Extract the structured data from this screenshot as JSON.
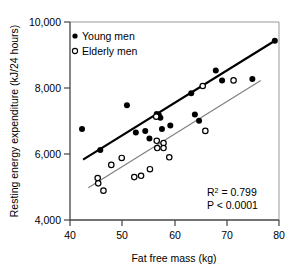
{
  "chart_data": {
    "type": "scatter",
    "title": "",
    "xlabel": "Fat free mass (kg)",
    "ylabel": "Resting energy expenditure (kJ/24 hours)",
    "xlim": [
      40,
      80
    ],
    "ylim": [
      4000,
      10000
    ],
    "xticks": [
      "40",
      "50",
      "60",
      "70",
      "80"
    ],
    "xtick_values": [
      40,
      50,
      60,
      70,
      80
    ],
    "yticks": [
      "4,000",
      "6,000",
      "8,000",
      "10,000"
    ],
    "ytick_values": [
      4000,
      6000,
      8000,
      10000
    ],
    "grid": false,
    "legend_position": "top-left",
    "series": [
      {
        "name": "Young men",
        "marker": "filled-circle",
        "color": "#000000",
        "points": [
          [
            42.3,
            6760
          ],
          [
            45.8,
            6120
          ],
          [
            50.9,
            7480
          ],
          [
            52.6,
            6650
          ],
          [
            54.4,
            6700
          ],
          [
            55.2,
            6470
          ],
          [
            56.6,
            7210
          ],
          [
            57.0,
            7180
          ],
          [
            57.3,
            7100
          ],
          [
            57.6,
            6760
          ],
          [
            59.2,
            6860
          ],
          [
            63.2,
            7840
          ],
          [
            63.9,
            7200
          ],
          [
            64.7,
            7010
          ],
          [
            67.9,
            8530
          ],
          [
            69.1,
            8230
          ],
          [
            74.9,
            8270
          ],
          [
            79.2,
            9430
          ]
        ]
      },
      {
        "name": "Elderly men",
        "marker": "open-circle",
        "color": "#000000",
        "points": [
          [
            45.3,
            5270
          ],
          [
            45.4,
            5110
          ],
          [
            46.4,
            4890
          ],
          [
            47.9,
            5670
          ],
          [
            49.9,
            5880
          ],
          [
            52.3,
            5300
          ],
          [
            53.6,
            5340
          ],
          [
            55.3,
            5540
          ],
          [
            56.5,
            7130
          ],
          [
            56.6,
            6400
          ],
          [
            56.7,
            6180
          ],
          [
            57.9,
            6330
          ],
          [
            57.9,
            6180
          ],
          [
            59.0,
            5900
          ],
          [
            65.4,
            8060
          ],
          [
            65.9,
            6700
          ],
          [
            71.3,
            8230
          ]
        ]
      }
    ],
    "trendlines": [
      {
        "name": "Young men regression",
        "color": "#000000",
        "width": 2.2,
        "x_start": 42.5,
        "y_start": 5830,
        "x_end": 79.2,
        "y_end": 9430
      },
      {
        "name": "Elderly men regression",
        "color": "#808080",
        "width": 1.2,
        "x_start": 43.5,
        "y_start": 4980,
        "x_end": 76.5,
        "y_end": 8230
      }
    ],
    "annotations": [
      {
        "name": "r-squared",
        "text": "R",
        "superscript": "2",
        "rest": " = 0.799"
      },
      {
        "name": "p-value",
        "text": "P < 0.0001"
      }
    ]
  },
  "legend": {
    "items": [
      {
        "label": "Young men",
        "marker": "filled-circle"
      },
      {
        "label": "Elderly men",
        "marker": "open-circle"
      }
    ]
  },
  "annotation_text": {
    "r_squared_prefix": "R",
    "r_squared_exponent": "2",
    "r_squared_value": " = 0.799",
    "p_value": "P < 0.0001"
  },
  "axis": {
    "x_title": "Fat free mass (kg)",
    "y_title": "Resting energy expenditure (kJ/24 hours)"
  }
}
